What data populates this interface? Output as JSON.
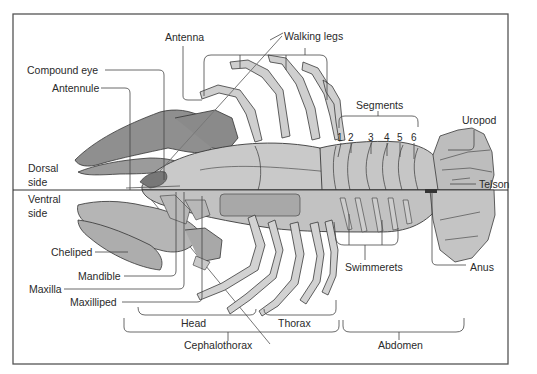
{
  "figure": {
    "colors": {
      "frame": "#555555",
      "body_fill": "#c9c9c9",
      "body_dark": "#9a9a9a",
      "outline": "#3a3a3a",
      "leader": "#444444",
      "text": "#2a2a2a",
      "background": "#ffffff"
    }
  },
  "labels": {
    "antenna": "Antenna",
    "walking_legs": "Walking legs",
    "compound_eye": "Compound eye",
    "antennule": "Antennule",
    "segments": "Segments",
    "uropod": "Uropod",
    "dorsal_1": "Dorsal",
    "dorsal_2": "side",
    "telson": "Telson",
    "ventral_1": "Ventral",
    "ventral_2": "side",
    "cheliped": "Cheliped",
    "mandible": "Mandible",
    "maxilla": "Maxilla",
    "maxilliped": "Maxilliped",
    "swimmerets": "Swimmerets",
    "anus": "Anus",
    "head": "Head",
    "thorax": "Thorax",
    "cephalothorax": "Cephalothorax",
    "abdomen": "Abdomen"
  },
  "segment_numbers": [
    "1",
    "2",
    "3",
    "4",
    "5",
    "6"
  ]
}
